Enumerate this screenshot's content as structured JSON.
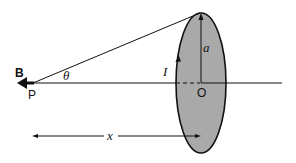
{
  "diagram": {
    "labels": {
      "field": "B",
      "point": "P",
      "angle": "θ",
      "current": "I",
      "radius": "a",
      "center": "O",
      "distance": "x"
    },
    "colors": {
      "loop_fill": "#a9a9a9",
      "stroke": "#111111",
      "background": "#ffffff"
    }
  }
}
